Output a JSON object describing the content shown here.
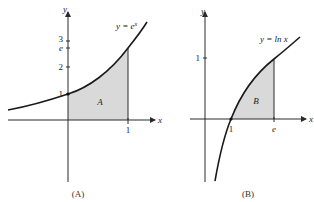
{
  "panels": [
    {
      "id": "A",
      "caption": "(A)",
      "function_label": "y = e",
      "function_label_sup": "x",
      "region_label": "A",
      "x_axis_label": "x",
      "y_axis_label": "y",
      "x_ticks": [
        "1"
      ],
      "y_ticks": [
        "1",
        "2",
        "e",
        "3"
      ],
      "shaded_interval": [
        "0",
        "1"
      ]
    },
    {
      "id": "B",
      "caption": "(B)",
      "function_label": "y = ln x",
      "region_label": "B",
      "x_axis_label": "x",
      "y_axis_label": "y",
      "x_ticks": [
        "1",
        "e"
      ],
      "y_ticks": [
        "1"
      ],
      "shaded_interval": [
        "1",
        "e"
      ]
    }
  ],
  "colors": {
    "shade": "#d9d9d9",
    "ink": "#1a1a1a"
  }
}
